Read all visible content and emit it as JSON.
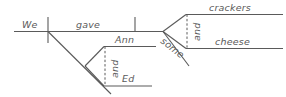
{
  "diagram": {
    "type": "sentence-diagram",
    "style": "reed-kellogg",
    "sentence": "We gave Ann and Ed some crackers and cheese.",
    "canvas": {
      "width": 286,
      "height": 97
    },
    "colors": {
      "stroke": "#5a5a5a",
      "text": "#5a5a5a",
      "background": "#ffffff"
    },
    "words": {
      "subject": "We",
      "verb": "gave",
      "indirect_object_1": "Ann",
      "indirect_object_conjunction": "and",
      "indirect_object_2": "Ed",
      "modifier": "some",
      "direct_object_1": "crackers",
      "direct_object_conjunction": "and",
      "direct_object_2": "cheese"
    }
  }
}
